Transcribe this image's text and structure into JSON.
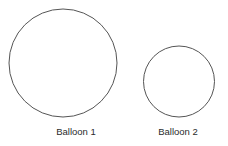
{
  "figure": {
    "width": 227,
    "height": 146,
    "background_color": "#ffffff",
    "stroke_color": "#555555",
    "label_color": "#2b2b2b"
  },
  "balloons": [
    {
      "label": "Balloon 1",
      "shape": "circle",
      "center_x": 63,
      "center_y": 63,
      "diameter": 109,
      "radius": 54.5,
      "label_center_x": 76,
      "label_baseline_y": 135
    },
    {
      "label": "Balloon 2",
      "shape": "circle",
      "center_x": 179,
      "center_y": 81.5,
      "diameter": 72,
      "radius": 36,
      "label_center_x": 178,
      "label_baseline_y": 135
    }
  ]
}
